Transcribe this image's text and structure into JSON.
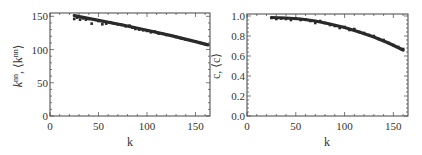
{
  "chart_data": [
    {
      "type": "scatter",
      "title": "",
      "xlabel": "k",
      "ylabel": "k^nn, ⟨k^nn⟩",
      "ylabel_parts": {
        "main": "k",
        "sup1": "nn",
        "sep": ", ⟨",
        "main2": "k",
        "sup2": "nn",
        "end": "⟩"
      },
      "xlim": [
        0,
        165
      ],
      "ylim": [
        0,
        155
      ],
      "xticks": [
        0,
        50,
        100,
        150
      ],
      "yticks": [
        0,
        50,
        100,
        150
      ],
      "grid": false,
      "legend": null,
      "series": [
        {
          "name": "fit (line)",
          "style": "line",
          "x": [
            25,
            50,
            75,
            100,
            125,
            150,
            163
          ],
          "y": [
            151,
            144,
            137,
            129,
            121,
            112,
            107
          ]
        },
        {
          "name": "data (points)",
          "style": "points",
          "x": [
            25,
            28,
            31,
            34,
            37,
            40,
            43,
            46,
            50,
            54,
            58,
            62,
            66,
            70,
            74,
            78,
            82,
            85,
            88,
            92,
            96,
            100,
            104,
            108,
            112,
            116,
            120,
            125,
            130,
            135,
            140,
            145,
            150,
            155,
            160
          ],
          "y": [
            146,
            148,
            145,
            147,
            145,
            146,
            139,
            145,
            143,
            138,
            139,
            141,
            139,
            138,
            137,
            135,
            136,
            133,
            131,
            130,
            129,
            128,
            126,
            127,
            124,
            124,
            122,
            121,
            119,
            117,
            115,
            114,
            112,
            110,
            108
          ]
        }
      ]
    },
    {
      "type": "scatter",
      "title": "",
      "xlabel": "k",
      "ylabel": "c, ⟨c⟩",
      "xlim": [
        0,
        165
      ],
      "ylim": [
        0,
        1.02
      ],
      "xticks": [
        0,
        50,
        100,
        150
      ],
      "yticks": [
        0.0,
        0.2,
        0.4,
        0.6,
        0.8,
        1.0
      ],
      "grid": false,
      "legend": null,
      "series": [
        {
          "name": "fit (line)",
          "style": "line",
          "x": [
            25,
            40,
            55,
            70,
            85,
            100,
            115,
            130,
            145,
            160
          ],
          "y": [
            0.985,
            0.98,
            0.97,
            0.95,
            0.92,
            0.885,
            0.84,
            0.79,
            0.73,
            0.66
          ]
        },
        {
          "name": "data (points)",
          "style": "points",
          "x": [
            25,
            30,
            35,
            40,
            45,
            50,
            55,
            60,
            65,
            70,
            75,
            80,
            85,
            90,
            95,
            100,
            105,
            110,
            115,
            120,
            125,
            130,
            135,
            140,
            145,
            150,
            155,
            160
          ],
          "y": [
            0.98,
            0.97,
            0.975,
            0.97,
            0.96,
            0.975,
            0.96,
            0.965,
            0.95,
            0.93,
            0.95,
            0.93,
            0.91,
            0.9,
            0.88,
            0.89,
            0.86,
            0.87,
            0.84,
            0.83,
            0.81,
            0.8,
            0.77,
            0.76,
            0.73,
            0.71,
            0.69,
            0.67
          ]
        }
      ]
    }
  ],
  "charts": [
    {
      "xlabel": "k",
      "ylabel_main": "k",
      "ylabel_sup": "nn",
      "ylabel_rest": ", ⟨k",
      "ylabel_sup2": "nn",
      "ylabel_close": "⟩",
      "xtick_labels": [
        "0",
        "50",
        "100",
        "150"
      ],
      "ytick_labels": [
        "0",
        "50",
        "100",
        "150"
      ]
    },
    {
      "xlabel": "k",
      "ylabel": "c, ⟨c⟩",
      "xtick_labels": [
        "0",
        "50",
        "100",
        "150"
      ],
      "ytick_labels": [
        "0.0",
        "0.2",
        "0.4",
        "0.6",
        "0.8",
        "1.0"
      ]
    }
  ],
  "colors": {
    "frame": "#444444",
    "series": "#2a2a2a",
    "text": "#333333"
  }
}
